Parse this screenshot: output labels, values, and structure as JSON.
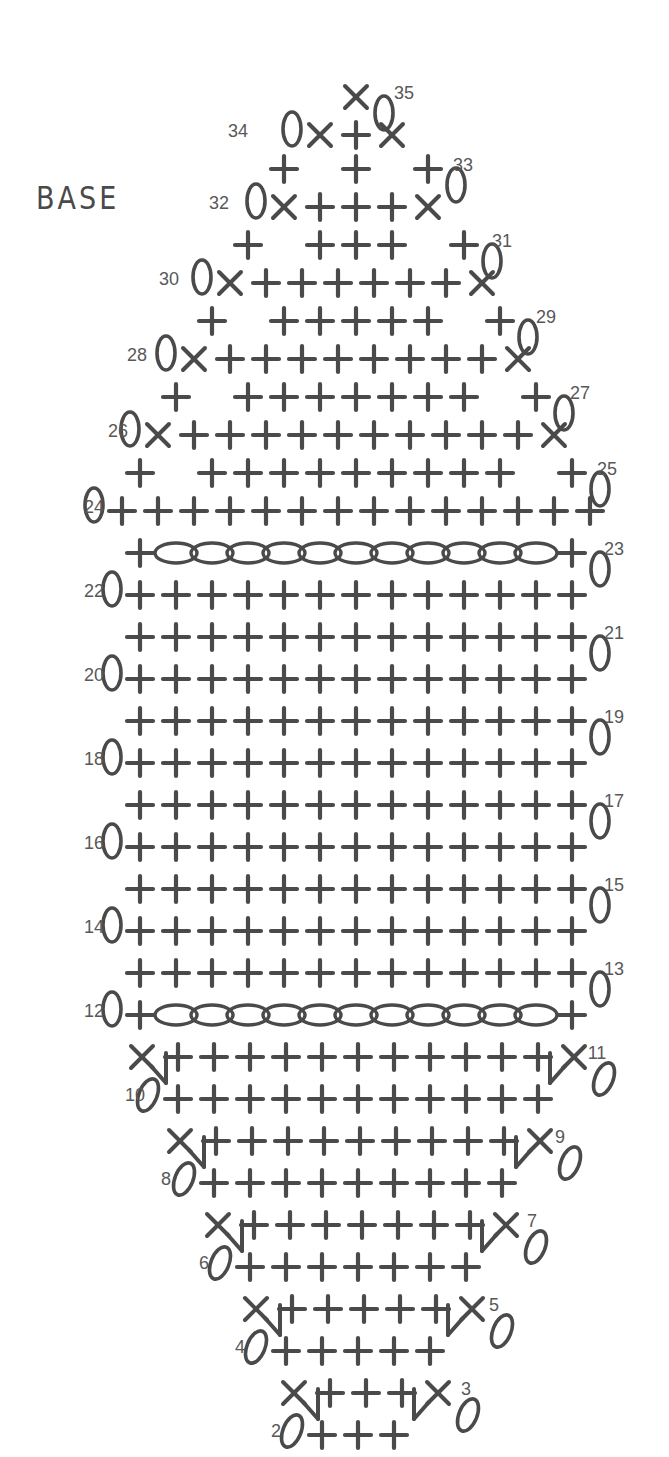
{
  "title_label": "BASE",
  "colors": {
    "ink": "#4a4a4a",
    "number_ink": "#585858",
    "background": "#ffffff"
  },
  "legend_symbols": {
    "single_crochet": "+",
    "decrease": "X",
    "chain": "0",
    "chain_oval": "oval",
    "magic_ring": "ring"
  },
  "chart_data": {
    "type": "diagram",
    "title": "BASE",
    "subtitle": "",
    "xlabel": "",
    "ylabel": "",
    "row_count": 35,
    "row_number_labels": [
      1,
      2,
      3,
      4,
      5,
      6,
      7,
      8,
      9,
      10,
      11,
      12,
      13,
      14,
      15,
      16,
      17,
      18,
      19,
      20,
      21,
      22,
      23,
      24,
      25,
      26,
      27,
      28,
      29,
      30,
      31,
      32,
      33,
      34,
      35
    ],
    "odd_rows_label_side": "right",
    "even_rows_label_side": "left",
    "rows": [
      {
        "n": 1,
        "y": 1345,
        "label_side": "right",
        "label_x": 438,
        "cx": 372,
        "symbols": [
          "X",
          "+",
          "X"
        ],
        "spacing": 36,
        "turning_chain": "tilt",
        "converge": true
      },
      {
        "n": 2,
        "y": 1300,
        "label_side": "left",
        "label_x": 276,
        "cx": 358,
        "symbols": [
          "+",
          "+",
          "+"
        ],
        "spacing": 36,
        "lead_chain": "tall"
      },
      {
        "n": 3,
        "y": 1258,
        "label_side": "right",
        "label_x": 466,
        "cx": 366,
        "symbols": [
          "X",
          "+",
          "+",
          "+",
          "X"
        ],
        "spacing": 36,
        "turning_chain": "tilt",
        "dec_legs": true
      },
      {
        "n": 4,
        "y": 1216,
        "label_side": "left",
        "label_x": 240,
        "cx": 358,
        "symbols": [
          "+",
          "+",
          "+",
          "+",
          "+"
        ],
        "spacing": 36,
        "lead_chain": "tall"
      },
      {
        "n": 5,
        "y": 1174,
        "label_side": "right",
        "label_x": 494,
        "cx": 364,
        "symbols": [
          "X",
          "+",
          "+",
          "+",
          "+",
          "+",
          "X"
        ],
        "spacing": 36,
        "turning_chain": "tilt",
        "dec_legs": true
      },
      {
        "n": 6,
        "y": 1132,
        "label_side": "left",
        "label_x": 204,
        "cx": 358,
        "symbols": [
          "+",
          "+",
          "+",
          "+",
          "+",
          "+",
          "+"
        ],
        "spacing": 36,
        "lead_chain": "tall"
      },
      {
        "n": 7,
        "y": 1090,
        "label_side": "right",
        "label_x": 532,
        "cx": 362,
        "symbols": [
          "X",
          "+",
          "+",
          "+",
          "+",
          "+",
          "+",
          "+",
          "X"
        ],
        "spacing": 36,
        "turning_chain": "tilt",
        "dec_legs": true
      },
      {
        "n": 8,
        "y": 1048,
        "label_side": "left",
        "label_x": 166,
        "cx": 358,
        "symbols": [
          "+",
          "+",
          "+",
          "+",
          "+",
          "+",
          "+",
          "+",
          "+"
        ],
        "spacing": 36,
        "lead_chain": "tall"
      },
      {
        "n": 9,
        "y": 1006,
        "label_side": "right",
        "label_x": 560,
        "cx": 360,
        "symbols": [
          "X",
          "+",
          "+",
          "+",
          "+",
          "+",
          "+",
          "+",
          "+",
          "+",
          "X"
        ],
        "spacing": 36,
        "turning_chain": "tilt",
        "dec_legs": true
      },
      {
        "n": 10,
        "y": 964,
        "label_side": "left",
        "label_x": 135,
        "cx": 358,
        "symbols": [
          "+",
          "+",
          "+",
          "+",
          "+",
          "+",
          "+",
          "+",
          "+",
          "+",
          "+"
        ],
        "spacing": 36,
        "lead_chain": "tall"
      },
      {
        "n": 11,
        "y": 922,
        "label_side": "right",
        "label_x": 597,
        "cx": 358,
        "symbols": [
          "X",
          "+",
          "+",
          "+",
          "+",
          "+",
          "+",
          "+",
          "+",
          "+",
          "+",
          "+",
          "X"
        ],
        "spacing": 36,
        "turning_chain": "tilt",
        "dec_legs": true
      },
      {
        "n": 12,
        "y": 880,
        "label_side": "left",
        "label_x": 94,
        "cx": 356,
        "symbols": [
          "+",
          "oval",
          "oval",
          "oval",
          "oval",
          "oval",
          "oval",
          "oval",
          "oval",
          "oval",
          "oval",
          "oval",
          "+"
        ],
        "spacing": 36,
        "lead_chain": "tall",
        "chain_row": true
      },
      {
        "n": 13,
        "y": 838,
        "label_side": "right",
        "label_x": 614,
        "cx": 356,
        "symbols": [
          "+",
          "+",
          "+",
          "+",
          "+",
          "+",
          "+",
          "+",
          "+",
          "+",
          "+",
          "+",
          "+"
        ],
        "spacing": 36,
        "turning_chain": "tall"
      },
      {
        "n": 14,
        "y": 796,
        "label_side": "left",
        "label_x": 94,
        "cx": 356,
        "symbols": [
          "+",
          "+",
          "+",
          "+",
          "+",
          "+",
          "+",
          "+",
          "+",
          "+",
          "+",
          "+",
          "+"
        ],
        "spacing": 36,
        "lead_chain": "tall"
      },
      {
        "n": 15,
        "y": 754,
        "label_side": "right",
        "label_x": 614,
        "cx": 356,
        "symbols": [
          "+",
          "+",
          "+",
          "+",
          "+",
          "+",
          "+",
          "+",
          "+",
          "+",
          "+",
          "+",
          "+"
        ],
        "spacing": 36,
        "turning_chain": "tall"
      },
      {
        "n": 16,
        "y": 712,
        "label_side": "left",
        "label_x": 94,
        "cx": 356,
        "symbols": [
          "+",
          "+",
          "+",
          "+",
          "+",
          "+",
          "+",
          "+",
          "+",
          "+",
          "+",
          "+",
          "+"
        ],
        "spacing": 36,
        "lead_chain": "tall"
      },
      {
        "n": 17,
        "y": 670,
        "label_side": "right",
        "label_x": 614,
        "cx": 356,
        "symbols": [
          "+",
          "+",
          "+",
          "+",
          "+",
          "+",
          "+",
          "+",
          "+",
          "+",
          "+",
          "+",
          "+"
        ],
        "spacing": 36,
        "turning_chain": "tall"
      },
      {
        "n": 18,
        "y": 628,
        "label_side": "left",
        "label_x": 94,
        "cx": 356,
        "symbols": [
          "+",
          "+",
          "+",
          "+",
          "+",
          "+",
          "+",
          "+",
          "+",
          "+",
          "+",
          "+",
          "+"
        ],
        "spacing": 36,
        "lead_chain": "tall"
      },
      {
        "n": 19,
        "y": 586,
        "label_side": "right",
        "label_x": 614,
        "cx": 356,
        "symbols": [
          "+",
          "+",
          "+",
          "+",
          "+",
          "+",
          "+",
          "+",
          "+",
          "+",
          "+",
          "+",
          "+"
        ],
        "spacing": 36,
        "turning_chain": "tall"
      },
      {
        "n": 20,
        "y": 544,
        "label_side": "left",
        "label_x": 94,
        "cx": 356,
        "symbols": [
          "+",
          "+",
          "+",
          "+",
          "+",
          "+",
          "+",
          "+",
          "+",
          "+",
          "+",
          "+",
          "+"
        ],
        "spacing": 36,
        "lead_chain": "tall"
      },
      {
        "n": 21,
        "y": 502,
        "label_side": "right",
        "label_x": 614,
        "cx": 356,
        "symbols": [
          "+",
          "+",
          "+",
          "+",
          "+",
          "+",
          "+",
          "+",
          "+",
          "+",
          "+",
          "+",
          "+"
        ],
        "spacing": 36,
        "turning_chain": "tall"
      },
      {
        "n": 22,
        "y": 460,
        "label_side": "left",
        "label_x": 94,
        "cx": 356,
        "symbols": [
          "+",
          "+",
          "+",
          "+",
          "+",
          "+",
          "+",
          "+",
          "+",
          "+",
          "+",
          "+",
          "+"
        ],
        "spacing": 36,
        "lead_chain": "tall"
      },
      {
        "n": 23,
        "y": 418,
        "label_side": "right",
        "label_x": 614,
        "cx": 356,
        "symbols": [
          "+",
          "oval",
          "oval",
          "oval",
          "oval",
          "oval",
          "oval",
          "oval",
          "oval",
          "oval",
          "oval",
          "oval",
          "+"
        ],
        "spacing": 36,
        "turning_chain": "tall",
        "chain_row": true
      },
      {
        "n": 24,
        "y": 376,
        "label_side": "left",
        "label_x": 94,
        "cx": 356,
        "symbols": [
          "+",
          "+",
          "+",
          "+",
          "+",
          "+",
          "+",
          "+",
          "+",
          "+",
          "+",
          "+",
          "+",
          "+"
        ],
        "spacing": 36,
        "lead_chain": "tall"
      },
      {
        "n": 25,
        "y": 338,
        "label_side": "right",
        "label_x": 607,
        "cx": 356,
        "symbols": [
          "+",
          "gap",
          "+",
          "+",
          "+",
          "+",
          "+",
          "+",
          "+",
          "+",
          "+",
          "gap",
          "+"
        ],
        "spacing": 36,
        "turning_chain": "tall"
      },
      {
        "n": 26,
        "y": 300,
        "label_side": "left",
        "label_x": 118,
        "cx": 356,
        "symbols": [
          "X",
          "+",
          "+",
          "+",
          "+",
          "+",
          "+",
          "+",
          "+",
          "+",
          "+",
          "X"
        ],
        "spacing": 36,
        "lead_chain": "tall"
      },
      {
        "n": 27,
        "y": 262,
        "label_side": "right",
        "label_x": 580,
        "cx": 356,
        "symbols": [
          "+",
          "gap",
          "+",
          "+",
          "+",
          "+",
          "+",
          "+",
          "+",
          "gap",
          "+"
        ],
        "spacing": 36,
        "turning_chain": "tall"
      },
      {
        "n": 28,
        "y": 224,
        "label_side": "left",
        "label_x": 137,
        "cx": 356,
        "symbols": [
          "X",
          "+",
          "+",
          "+",
          "+",
          "+",
          "+",
          "+",
          "+",
          "X"
        ],
        "spacing": 36,
        "lead_chain": "tall"
      },
      {
        "n": 29,
        "y": 186,
        "label_side": "right",
        "label_x": 546,
        "cx": 356,
        "symbols": [
          "+",
          "gap",
          "+",
          "+",
          "+",
          "+",
          "+",
          "gap",
          "+"
        ],
        "spacing": 36,
        "turning_chain": "tall"
      },
      {
        "n": 30,
        "y": 148,
        "label_side": "left",
        "label_x": 169,
        "cx": 356,
        "symbols": [
          "X",
          "+",
          "+",
          "+",
          "+",
          "+",
          "+",
          "X"
        ],
        "spacing": 36,
        "lead_chain": "tall"
      },
      {
        "n": 31,
        "y": 110,
        "label_side": "right",
        "label_x": 502,
        "cx": 356,
        "symbols": [
          "+",
          "gap",
          "+",
          "+",
          "+",
          "gap",
          "+"
        ],
        "spacing": 36,
        "turning_chain": "tall"
      },
      {
        "n": 32,
        "y": 72,
        "label_side": "left",
        "label_x": 219,
        "cx": 356,
        "symbols": [
          "X",
          "+",
          "+",
          "+",
          "X"
        ],
        "spacing": 36,
        "lead_chain": "tall"
      },
      {
        "n": 33,
        "y": 34,
        "label_side": "right",
        "label_x": 463,
        "cx": 356,
        "symbols": [
          "+",
          "gap",
          "+",
          "gap",
          "+"
        ],
        "spacing": 36,
        "turning_chain": "tall"
      },
      {
        "n": 34,
        "y": 0,
        "label_side": "left",
        "label_x": 238,
        "cx": 356,
        "symbols": [
          "X",
          "+",
          "X"
        ],
        "spacing": 36,
        "lead_chain": "tall"
      },
      {
        "n": 35,
        "y": -38,
        "label_side": "right",
        "label_x": 404,
        "cx": 356,
        "symbols": [
          "X"
        ],
        "spacing": 36,
        "turning_chain": "tall"
      }
    ]
  }
}
